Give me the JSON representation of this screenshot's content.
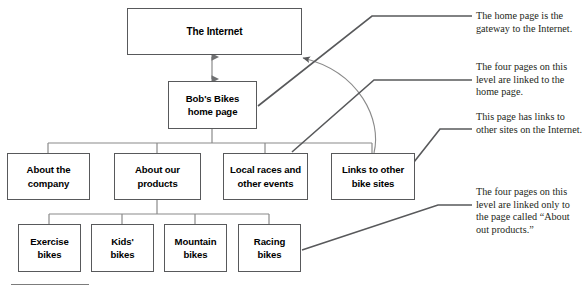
{
  "diagram": {
    "title_node": {
      "label": "The Internet"
    },
    "home_node": {
      "label": "Bob's Bikes\nhome page"
    },
    "level2": [
      {
        "label": "About the\ncompany"
      },
      {
        "label": "About our\nproducts"
      },
      {
        "label": "Local races and\nother events"
      },
      {
        "label": "Links to other\nbike sites"
      }
    ],
    "level3": [
      {
        "label": "Exercise\nbikes"
      },
      {
        "label": "Kids'\nbikes"
      },
      {
        "label": "Mountain\nbikes"
      },
      {
        "label": "Racing\nbikes"
      }
    ],
    "annotations": [
      {
        "text": "The home page is the gateway to the Internet."
      },
      {
        "text": "The four pages on this level are linked to the home page."
      },
      {
        "text": "This page has links to other sites on the Internet."
      },
      {
        "text": "The four pages on this level are linked only to the page called “About out products.”"
      }
    ],
    "colors": {
      "box_stroke": "#58595b",
      "connector": "#8a8a8a",
      "leader": "#58595b",
      "text": "#000000",
      "note_text": "#231f20",
      "background": "#ffffff"
    }
  }
}
